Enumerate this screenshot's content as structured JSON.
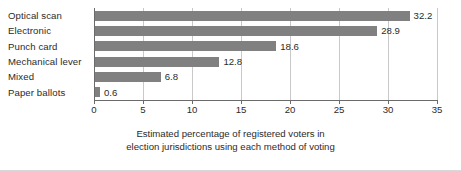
{
  "chart_data": {
    "type": "bar",
    "orientation": "horizontal",
    "title": "",
    "subtitle": "",
    "xlabel": "Estimated percentage of registered voters in election jurisdictions using each method of voting",
    "ylabel": "",
    "categories": [
      "Optical scan",
      "Electronic",
      "Punch card",
      "Mechanical lever",
      "Mixed",
      "Paper ballots"
    ],
    "values": [
      32.2,
      28.9,
      18.6,
      12.8,
      6.8,
      0.6
    ],
    "data_labels": [
      "32.2",
      "28.9",
      "18.6",
      "12.8",
      "6.8",
      "0.6"
    ],
    "xlim": [
      0,
      35
    ],
    "ylim": null,
    "xticks": [
      0,
      5,
      10,
      15,
      20,
      25,
      30,
      35
    ],
    "xtick_labels": [
      "0",
      "5",
      "10",
      "15",
      "20",
      "25",
      "30",
      "35"
    ],
    "grid": true,
    "grid_axis": "x",
    "legend": false,
    "legend_position": "none",
    "bar_color": "#808080",
    "axis_color": "#6b6b6b",
    "grid_color": "#c9c9c9",
    "text_color": "#2b2b2b",
    "background": "#ffffff"
  },
  "caption": {
    "line1": "Estimated percentage of registered voters in",
    "line2": "election jurisdictions using each method of voting"
  }
}
